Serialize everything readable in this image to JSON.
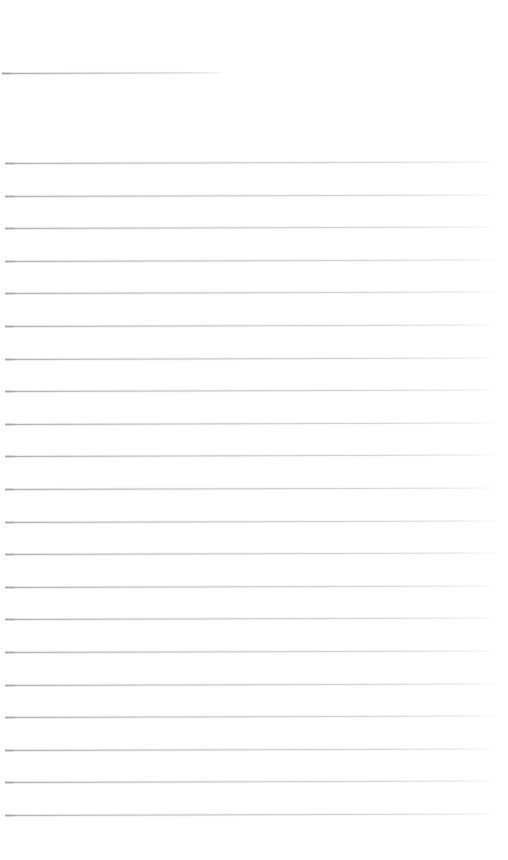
{
  "document": {
    "kind": "blank-ruled-paper",
    "page_width": 508,
    "page_height": 860,
    "background_color": "#ffffff",
    "rule_color": "#c9ccd0",
    "rule_thickness_px": 1,
    "rule_spacing_px": 32.6,
    "skew_degrees": -0.18,
    "text_content": "",
    "has_text": false,
    "has_images": false,
    "heading_rule_count": 1,
    "body_rule_count": 21,
    "total_rule_count": 22
  },
  "rules": [
    {
      "id": "heading-rule",
      "role": "heading-underline",
      "x": 2,
      "y": 73,
      "width": 220
    },
    {
      "id": "body-rule-1",
      "role": "body-rule",
      "x": 5,
      "y": 163.0,
      "width": 492
    },
    {
      "id": "body-rule-2",
      "role": "body-rule",
      "x": 5,
      "y": 195.6,
      "width": 492
    },
    {
      "id": "body-rule-3",
      "role": "body-rule",
      "x": 5,
      "y": 228.2,
      "width": 492
    },
    {
      "id": "body-rule-4",
      "role": "body-rule",
      "x": 5,
      "y": 260.8,
      "width": 492
    },
    {
      "id": "body-rule-5",
      "role": "body-rule",
      "x": 5,
      "y": 293.4,
      "width": 492
    },
    {
      "id": "body-rule-6",
      "role": "body-rule",
      "x": 5,
      "y": 326.0,
      "width": 492
    },
    {
      "id": "body-rule-7",
      "role": "body-rule",
      "x": 5,
      "y": 358.6,
      "width": 492
    },
    {
      "id": "body-rule-8",
      "role": "body-rule",
      "x": 5,
      "y": 391.2,
      "width": 492
    },
    {
      "id": "body-rule-9",
      "role": "body-rule",
      "x": 5,
      "y": 423.8,
      "width": 492
    },
    {
      "id": "body-rule-10",
      "role": "body-rule",
      "x": 5,
      "y": 456.4,
      "width": 492
    },
    {
      "id": "body-rule-11",
      "role": "body-rule",
      "x": 5,
      "y": 489.0,
      "width": 492
    },
    {
      "id": "body-rule-12",
      "role": "body-rule",
      "x": 5,
      "y": 521.6,
      "width": 492
    },
    {
      "id": "body-rule-13",
      "role": "body-rule",
      "x": 5,
      "y": 554.2,
      "width": 492
    },
    {
      "id": "body-rule-14",
      "role": "body-rule",
      "x": 5,
      "y": 586.8,
      "width": 492
    },
    {
      "id": "body-rule-15",
      "role": "body-rule",
      "x": 5,
      "y": 619.4,
      "width": 492
    },
    {
      "id": "body-rule-16",
      "role": "body-rule",
      "x": 5,
      "y": 652.0,
      "width": 492
    },
    {
      "id": "body-rule-17",
      "role": "body-rule",
      "x": 5,
      "y": 684.6,
      "width": 492
    },
    {
      "id": "body-rule-18",
      "role": "body-rule",
      "x": 5,
      "y": 717.2,
      "width": 492
    },
    {
      "id": "body-rule-19",
      "role": "body-rule",
      "x": 5,
      "y": 749.8,
      "width": 492
    },
    {
      "id": "body-rule-20",
      "role": "body-rule",
      "x": 5,
      "y": 782.4,
      "width": 492
    },
    {
      "id": "body-rule-21",
      "role": "body-rule",
      "x": 5,
      "y": 815.0,
      "width": 492
    }
  ]
}
